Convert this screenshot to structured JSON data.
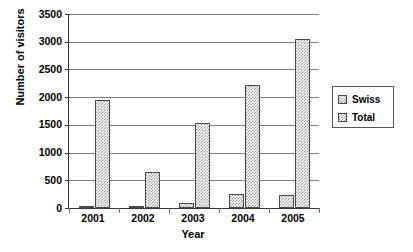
{
  "chart_data": {
    "type": "bar",
    "title": "",
    "xlabel": "Year",
    "ylabel": "Number of visitors",
    "categories": [
      "2001",
      "2002",
      "2003",
      "2004",
      "2005"
    ],
    "series": [
      {
        "name": "Swiss",
        "values": [
          40,
          15,
          90,
          250,
          230
        ]
      },
      {
        "name": "Total",
        "values": [
          1950,
          650,
          1530,
          2220,
          3050
        ]
      }
    ],
    "ylim": [
      0,
      3500
    ],
    "ytick_step": 500,
    "ytick_labels": [
      "0",
      "500",
      "1000",
      "1500",
      "2000",
      "2500",
      "3000",
      "3500"
    ],
    "grid": true,
    "legend_position": "right",
    "legend_entries": [
      "Swiss",
      "Total"
    ],
    "bar_fill": "#9a9a9a",
    "bar_border": "#4a4a4a",
    "axis_color": "#3a3a3a",
    "grid_color": "#808080",
    "background": "#ffffff"
  }
}
